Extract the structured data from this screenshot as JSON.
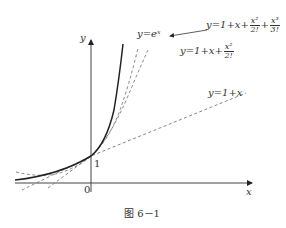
{
  "figure": {
    "caption": "图 6－1",
    "axes": {
      "x_label": "x",
      "y_label": "y",
      "origin_label": "0",
      "y_intercept_label": "1"
    },
    "curves": [
      {
        "name": "exp",
        "label": "y=eˣ",
        "style": "solid"
      },
      {
        "name": "taylor3",
        "label_prefix": "y=1+x+",
        "frac1_num": "x²",
        "frac1_den": "2!",
        "plus": "+",
        "frac2_num": "x³",
        "frac2_den": "3!",
        "style": "dashed"
      },
      {
        "name": "taylor2",
        "label_prefix": "y=1+x+",
        "frac1_num": "x²",
        "frac1_den": "2!",
        "style": "dashed"
      },
      {
        "name": "linear",
        "label": "y=1+x",
        "style": "dashed"
      }
    ],
    "colors": {
      "line": "#222222",
      "dash": "#777777",
      "text": "#333333"
    }
  }
}
